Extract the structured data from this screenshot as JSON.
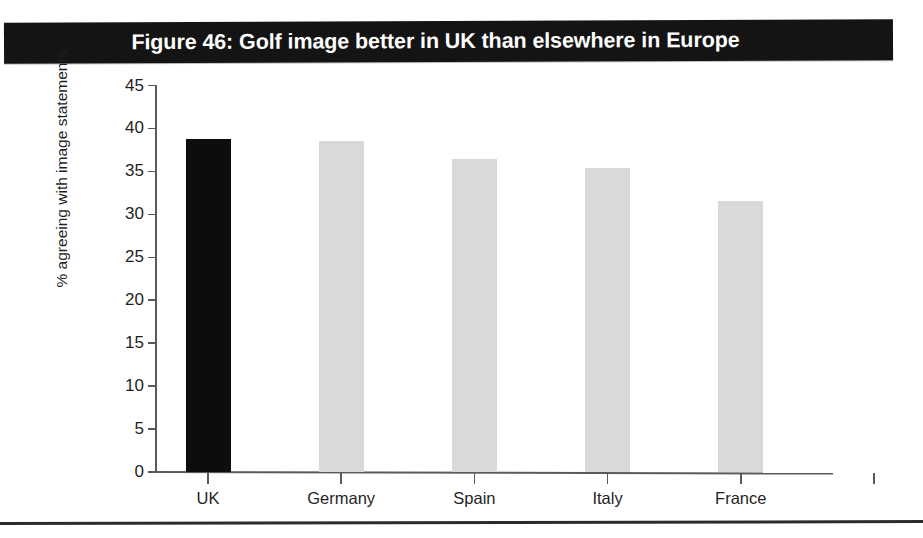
{
  "figure": {
    "title": "Figure 46: Golf image better in UK than elsewhere in Europe",
    "title_bar_color": "#141414",
    "title_text_color": "#ffffff"
  },
  "chart_data": {
    "type": "bar",
    "title": "Figure 46: Golf image better in UK than elsewhere in Europe",
    "xlabel": "",
    "ylabel": "% agreeing with image statements",
    "categories": [
      "UK",
      "Germany",
      "Spain",
      "Italy",
      "France"
    ],
    "values": [
      38.8,
      38.5,
      36.4,
      35.4,
      31.5
    ],
    "bar_colors": [
      "#0d0d0d",
      "#d9d9d9",
      "#d9d9d9",
      "#d9d9d9",
      "#d9d9d9"
    ],
    "ylim": [
      0,
      45
    ],
    "ytick_step": 5,
    "ytick_labels": [
      "0",
      "5",
      "10",
      "15",
      "20",
      "25",
      "30",
      "35",
      "40",
      "45"
    ],
    "ytick_values": [
      0,
      5,
      10,
      15,
      20,
      25,
      30,
      35,
      40,
      45
    ],
    "grid": false,
    "legend": null,
    "highlight_category": "UK",
    "highlight_color": "#0d0d0d",
    "series_color": "#d9d9d9"
  },
  "axes": {
    "axis_line_color": "#5a5a5a",
    "tick_color": "#5a5a5a",
    "label_color": "#1f1f1f"
  },
  "footer": {
    "rule_color": "#2b2b2b"
  }
}
